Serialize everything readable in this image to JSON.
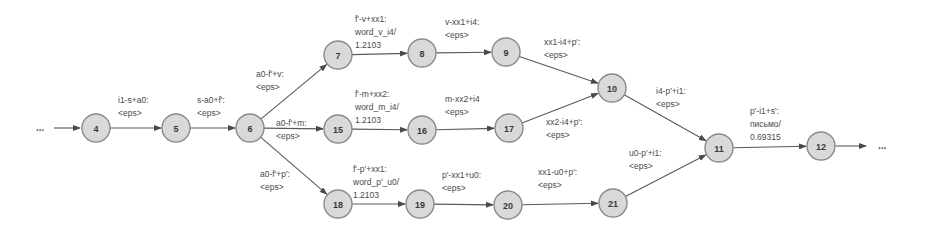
{
  "diagram": {
    "type": "finite-state-transducer",
    "colors": {
      "node_fill": "#d9d9d9",
      "node_stroke": "#8a8a8a",
      "edge": "#5a5a5a",
      "text": "#4a4a4a"
    },
    "start_ellipsis": "...",
    "end_ellipsis": "...",
    "nodes": [
      {
        "id": "4",
        "x": 96,
        "y": 128
      },
      {
        "id": "5",
        "x": 176,
        "y": 128
      },
      {
        "id": "6",
        "x": 250,
        "y": 128
      },
      {
        "id": "7",
        "x": 338,
        "y": 55
      },
      {
        "id": "8",
        "x": 422,
        "y": 53
      },
      {
        "id": "9",
        "x": 506,
        "y": 52
      },
      {
        "id": "15",
        "x": 338,
        "y": 129
      },
      {
        "id": "16",
        "x": 422,
        "y": 130
      },
      {
        "id": "17",
        "x": 509,
        "y": 128
      },
      {
        "id": "18",
        "x": 338,
        "y": 204
      },
      {
        "id": "19",
        "x": 420,
        "y": 204
      },
      {
        "id": "20",
        "x": 508,
        "y": 205
      },
      {
        "id": "21",
        "x": 613,
        "y": 203
      },
      {
        "id": "10",
        "x": 612,
        "y": 88
      },
      {
        "id": "11",
        "x": 719,
        "y": 148
      },
      {
        "id": "12",
        "x": 821,
        "y": 146
      }
    ],
    "edges": [
      {
        "from": "4",
        "to": "5",
        "label": [
          "i1-s+a0:",
          "<eps>"
        ]
      },
      {
        "from": "5",
        "to": "6",
        "label": [
          "s-a0+f':",
          "<eps>"
        ]
      },
      {
        "from": "6",
        "to": "7",
        "label": [
          "a0-f'+v:",
          "<eps>"
        ]
      },
      {
        "from": "6",
        "to": "15",
        "label": [
          "a0-f'+m:",
          "<eps>"
        ]
      },
      {
        "from": "6",
        "to": "18",
        "label": [
          "a0-f'+p':",
          "<eps>"
        ]
      },
      {
        "from": "7",
        "to": "8",
        "label": [
          "f'-v+xx1:",
          "word_v_i4/",
          "1.2103"
        ]
      },
      {
        "from": "8",
        "to": "9",
        "label": [
          "v-xx1+i4:",
          "<eps>"
        ]
      },
      {
        "from": "9",
        "to": "10",
        "label": [
          "xx1-i4+p':",
          "<eps>"
        ]
      },
      {
        "from": "15",
        "to": "16",
        "label": [
          "f'-m+xx2:",
          "word_m_i4/",
          "1.2103"
        ]
      },
      {
        "from": "16",
        "to": "17",
        "label": [
          "m-xx2+i4",
          "<eps>"
        ]
      },
      {
        "from": "17",
        "to": "10",
        "label": [
          "xx2-i4+p':",
          "<eps>"
        ]
      },
      {
        "from": "18",
        "to": "19",
        "label": [
          "f'-p'+xx1:",
          "word_p'_u0/",
          "1.2103"
        ]
      },
      {
        "from": "19",
        "to": "20",
        "label": [
          "p'-xx1+u0:",
          "<eps>"
        ]
      },
      {
        "from": "20",
        "to": "21",
        "label": [
          "xx1-u0+p':",
          "<eps>"
        ]
      },
      {
        "from": "10",
        "to": "11",
        "label": [
          "i4-p'+i1:",
          "<eps>"
        ]
      },
      {
        "from": "21",
        "to": "11",
        "label": [
          "u0-p'+i1:",
          "<eps>"
        ]
      },
      {
        "from": "11",
        "to": "12",
        "label": [
          "p'-i1+s':",
          "письмо/",
          "0.69315"
        ]
      }
    ]
  }
}
